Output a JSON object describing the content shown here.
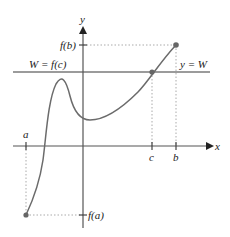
{
  "diagram": {
    "type": "intermediate-value-theorem-graph",
    "axes": {
      "x_label": "x",
      "y_label": "y"
    },
    "x_ticks": [
      {
        "label": "a"
      },
      {
        "label": "c"
      },
      {
        "label": "b"
      }
    ],
    "y_ticks": [
      {
        "label": "f(b)"
      },
      {
        "label": "f(a)"
      }
    ],
    "horizontal_line": {
      "left_label": "W = f(c)",
      "right_label": "y = W"
    },
    "points": [
      {
        "name": "(a, f(a))"
      },
      {
        "name": "(c, f(c))"
      },
      {
        "name": "(b, f(b))"
      }
    ],
    "colors": {
      "curve": "#6b6b6b",
      "axes": "#555555",
      "line_W": "#7a7a7a",
      "dotted": "#aaaaaa",
      "points": "#666666",
      "text": "#222222"
    }
  }
}
